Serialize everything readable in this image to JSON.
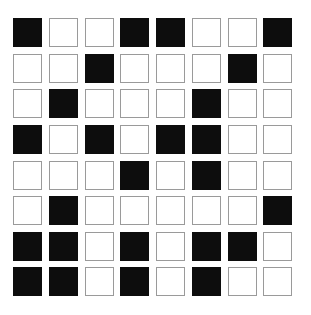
{
  "page": {
    "background_color": "#ffffff",
    "clipped_top_text": "· ·  ·· · ··   · ·  ·· ·  ··  · ·· ·  ··· ·"
  },
  "chart_data": {
    "type": "heatmap",
    "title": "",
    "subtitle": "",
    "xlabel": "",
    "ylabel": "",
    "rows": 8,
    "columns": 8,
    "grid": [
      [
        1,
        0,
        0,
        1,
        1,
        0,
        0,
        1
      ],
      [
        0,
        0,
        1,
        0,
        0,
        0,
        1,
        0
      ],
      [
        0,
        1,
        0,
        0,
        0,
        1,
        0,
        0
      ],
      [
        1,
        0,
        1,
        0,
        1,
        1,
        0,
        0
      ],
      [
        0,
        0,
        0,
        1,
        0,
        1,
        0,
        0
      ],
      [
        0,
        1,
        0,
        0,
        0,
        0,
        0,
        1
      ],
      [
        1,
        1,
        0,
        1,
        0,
        1,
        1,
        0
      ],
      [
        1,
        1,
        0,
        1,
        0,
        1,
        0,
        0
      ]
    ],
    "value_legend": {
      "0": "empty",
      "1": "filled"
    },
    "colors": {
      "filled": "#0d0d0d",
      "empty": "#ffffff",
      "empty_border": "#9a9a9a",
      "background": "#ffffff"
    },
    "filled_count": 26,
    "empty_count": 38,
    "grid_lines": false,
    "legend_position": "none",
    "x_tick_labels": [],
    "y_tick_labels": []
  }
}
